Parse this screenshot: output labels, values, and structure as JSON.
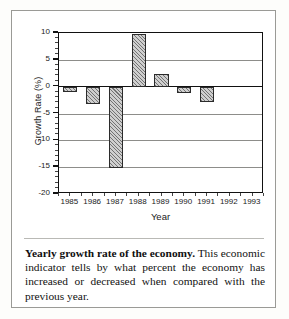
{
  "figure": {
    "caption_lead": "Yearly growth rate of the economy.",
    "caption_body": " This economic indicator tells by what percent the economy has increased or decreased when compared with the previous year."
  },
  "chart_data": {
    "type": "bar",
    "title": "",
    "xlabel": "Year",
    "ylabel": "Growth Rate (%)",
    "categories": [
      "1985",
      "1986",
      "1987",
      "1988",
      "1989",
      "1990",
      "1991",
      "1992",
      "1993"
    ],
    "values": [
      -1.0,
      -3.3,
      -15.2,
      9.8,
      2.4,
      -1.1,
      -2.8,
      null,
      null
    ],
    "ylim": [
      -20,
      10
    ],
    "ytick_labels": [
      "10",
      "5",
      "0",
      "-5",
      "-10",
      "-15",
      "-20"
    ],
    "ytick_values": [
      10,
      5,
      0,
      -5,
      -10,
      -15,
      -20
    ],
    "yminor_step": 1,
    "grid": true,
    "legend": "none",
    "bar_fill": "diagonal-hatch",
    "axis_color": "#111111",
    "grid_color": "#8d8d8a"
  }
}
